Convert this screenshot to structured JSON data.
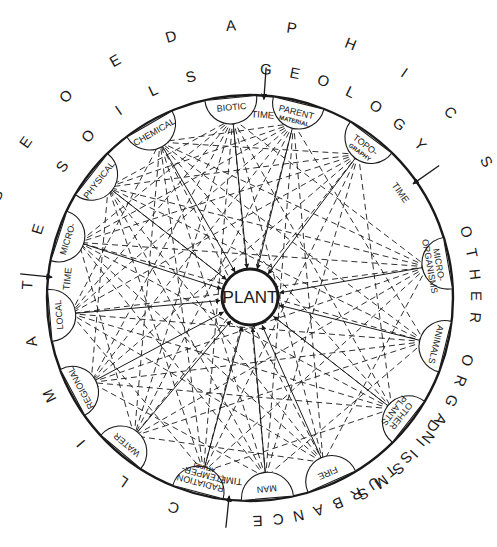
{
  "diagram": {
    "center_label": "PLANT",
    "outer_rings": [
      {
        "id": "geoedaphics",
        "text": "GEOEDAPHICS",
        "start_angle": -68,
        "end_angle": 60,
        "radius": 272
      },
      {
        "id": "soils",
        "text": "SOILS",
        "start_angle": -55,
        "end_angle": -15,
        "radius": 228
      },
      {
        "id": "geology",
        "text": "GEOLOGY",
        "start_angle": 4,
        "end_angle": 48,
        "radius": 228
      },
      {
        "id": "other-organisms",
        "text": "OTHER ORGANISMS",
        "start_angle": 73,
        "end_angle": 150,
        "radius": 225
      },
      {
        "id": "disturbance",
        "text": "DISTURBANCE",
        "start_angle": 125,
        "end_angle": 178,
        "radius": 222
      },
      {
        "id": "climate",
        "text": "CLIMATE",
        "start_angle": 200,
        "end_angle": 288,
        "radius": 222
      }
    ],
    "nodes": [
      {
        "id": "biotic",
        "label": "BIOTIC",
        "sub": "",
        "angle": -5.5
      },
      {
        "id": "parent-material",
        "label": "PARENT",
        "sub": "MATERIAL",
        "angle": 14
      },
      {
        "id": "topography",
        "label": "TOPO-",
        "sub": "GRAPHY",
        "angle": 37,
        "label2": "GRAPHY"
      },
      {
        "id": "micro-organisms",
        "label": "MICRO-",
        "label2": "ORGANISMS",
        "angle": 80
      },
      {
        "id": "animals",
        "label": "ANIMALS",
        "angle": 104
      },
      {
        "id": "other-plants",
        "label": "OTHER",
        "label2": "PLANTS",
        "angle": 128
      },
      {
        "id": "fire",
        "label": "FIRE",
        "angle": 156
      },
      {
        "id": "man",
        "label": "MAN",
        "angle": 175
      },
      {
        "id": "radiation",
        "label": "RADIATION",
        "label2": "(TEMPER-",
        "label3": "ATURE)",
        "angle": 195
      },
      {
        "id": "water",
        "label": "WATER",
        "angle": 220
      },
      {
        "id": "regional",
        "label": "REGIONAL",
        "angle": 242
      },
      {
        "id": "local",
        "label": "LOCAL",
        "angle": 265
      },
      {
        "id": "micro-climate",
        "label": "MICRO-",
        "angle": 288
      },
      {
        "id": "physical",
        "label": "PHYSICAL",
        "angle": 308
      },
      {
        "id": "chemical",
        "label": "CHEMICAL",
        "angle": 330
      }
    ],
    "time_markers": [
      {
        "id": "time-top",
        "label": "TIME",
        "angle": 4
      },
      {
        "id": "time-right",
        "label": "TIME",
        "angle": 55
      },
      {
        "id": "time-bottom",
        "label": "TIME",
        "angle": 186
      },
      {
        "id": "time-left",
        "label": "TIME",
        "angle": 276
      }
    ],
    "colors": {
      "ink": "#1a1a1a",
      "background": "#ffffff"
    }
  }
}
